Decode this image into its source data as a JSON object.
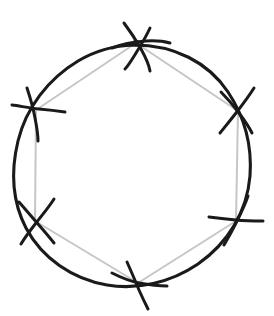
{
  "figure": {
    "canvas": {
      "width": 274,
      "height": 316
    },
    "background_color": "#ffffff"
  },
  "colors": {
    "circle_stroke": "#1a1a1a",
    "hexagon_stroke": "#c6c6c6",
    "arc_mark_stroke": "#1a1a1a",
    "vertex_dot_fill": "#1a1a1a",
    "background": "#ffffff"
  },
  "circle": {
    "name": "construction-circle",
    "center_x": 134,
    "center_y": 164,
    "radius": 119,
    "stroke_width": 3.1,
    "wobble_path": "M 134 45 C 174 45 208 62 228 92 C 246 119 252 148 250 176 C 247 212 228 243 198 264 C 170 283 137 290 107 285 C 72 279 42 258 26 228 C 12 201 11 170 18 141 C 26 108 48 79 78 61 C 95 51 115 45.5 134 45 Z"
  },
  "hexagon": {
    "name": "inscribed-hexagon",
    "sides": 6,
    "stroke_width": 2.0,
    "vertices": [
      {
        "label": "top",
        "x": 136,
        "y": 43
      },
      {
        "label": "upper-right",
        "x": 238,
        "y": 111
      },
      {
        "label": "lower-right",
        "x": 236,
        "y": 221
      },
      {
        "label": "bottom",
        "x": 138,
        "y": 283
      },
      {
        "label": "lower-left",
        "x": 35,
        "y": 221
      },
      {
        "label": "upper-left",
        "x": 36,
        "y": 110
      }
    ],
    "path": "M 136 43 L 238 111 L 236 221 L 138 283 L 35 221 L 36 110 Z"
  },
  "arc_marks": [
    {
      "name": "arc-mark-top",
      "vertex": "top",
      "stroke_width": 3.0,
      "strokes": [
        "M 112 48 C 122 44 133 42 146 41 C 155 40.5 163 41 170 43",
        "M 124 23 C 130 31 136 40 141 49 C 146 58 149 65 150 71",
        "M 150 28 C 146 37 141 45 136 53 C 131 61 128 66 125 69"
      ]
    },
    {
      "name": "arc-mark-upper-right",
      "vertex": "upper-right",
      "stroke_width": 3.0,
      "strokes": [
        "M 221 92 C 227 98 233 105 239 113 C 245 121 249 127 252 133",
        "M 254 88 C 249 96 243 104 236 113 C 229 122 224 128 220 133"
      ]
    },
    {
      "name": "arc-mark-upper-left",
      "vertex": "upper-left",
      "stroke_width": 3.0,
      "strokes": [
        "M 12 105 C 20 106 29 108 39 109 C 50 110 58 111 65 112",
        "M 27 88 C 30 97 33 107 35 118 C 37 128 38 135 38 141"
      ]
    },
    {
      "name": "arc-mark-lower-left",
      "vertex": "lower-left",
      "stroke_width": 3.0,
      "strokes": [
        "M 19 202 C 25 209 31 216 38 224 C 45 232 50 238 54 243",
        "M 54 199 C 49 207 43 214 36 223 C 29 232 24 239 21 244"
      ]
    },
    {
      "name": "arc-mark-lower-right",
      "vertex": "lower-right",
      "stroke_width": 3.0,
      "strokes": [
        "M 209 217 C 217 218 226 219 236 220 C 247 221 256 221 263 221",
        "M 248 196 C 245 205 241 213 236 223 C 231 233 227 240 224 245"
      ]
    },
    {
      "name": "arc-mark-bottom",
      "vertex": "bottom",
      "stroke_width": 3.0,
      "strokes": [
        "M 112 273 C 120 277 129 281 139 283 C 150 285 159 286 167 286",
        "M 127 262 C 131 271 135 280 139 290 C 143 299 146 305 148 309"
      ]
    }
  ],
  "vertex_dot": {
    "name": "top-vertex-dot",
    "x": 136,
    "y": 43,
    "radius": 3.2
  }
}
